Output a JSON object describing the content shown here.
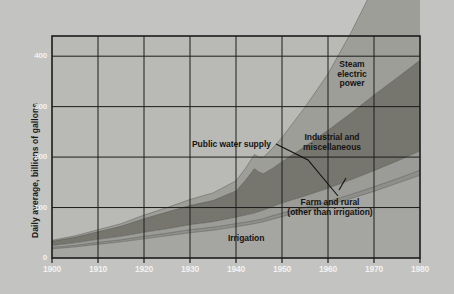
{
  "figure": {
    "background_color": "#c3c3c1",
    "plot_background_color": "#b9b9b6",
    "frame_color": "#1c1c1c"
  },
  "axes": {
    "y_title": "Daily average, billions of gallons",
    "y_ticks": [
      "0",
      "100",
      "200",
      "300",
      "400"
    ],
    "y_tick_values": [
      0,
      100,
      200,
      300,
      400
    ],
    "x_ticks": [
      "1900",
      "1910",
      "1920",
      "1930",
      "1940",
      "1950",
      "1960",
      "1970",
      "1980"
    ],
    "x_tick_values": [
      1900,
      1910,
      1920,
      1930,
      1940,
      1950,
      1960,
      1970,
      1980
    ],
    "tick_label_color": "#f2f2f0",
    "grid": true
  },
  "annotations": [
    {
      "name": "steam-electric-power",
      "lines": [
        "Steam",
        "electric",
        "power"
      ],
      "x": 352,
      "y": 60,
      "align": "center"
    },
    {
      "name": "industrial-and-miscellaneous",
      "lines": [
        "Industrial and",
        "miscellaneous"
      ],
      "x": 332,
      "y": 133,
      "align": "center"
    },
    {
      "name": "public-water-supply",
      "lines": [
        "Public water supply"
      ],
      "x": 192,
      "y": 140,
      "align": "left"
    },
    {
      "name": "farm-and-rural",
      "lines": [
        "Farm and rural",
        "(other than irrigation)"
      ],
      "x": 330,
      "y": 198,
      "align": "center"
    },
    {
      "name": "irrigation",
      "lines": [
        "Irrigation"
      ],
      "x": 228,
      "y": 234,
      "align": "left"
    }
  ],
  "chart_data": {
    "type": "area",
    "title": "",
    "subtitle": "",
    "xlabel": "",
    "ylabel": "Daily average, billions of gallons",
    "xlim": [
      1900,
      1980
    ],
    "ylim": [
      0,
      440
    ],
    "grid": true,
    "legend": "inline-annotations",
    "stacked": true,
    "units": "billions of gallons per day",
    "x": [
      1900,
      1905,
      1910,
      1915,
      1920,
      1925,
      1930,
      1935,
      1940,
      1942,
      1944,
      1945,
      1946,
      1948,
      1950,
      1955,
      1960,
      1965,
      1970,
      1975,
      1980
    ],
    "series": [
      {
        "name": "Irrigation",
        "color": "#a5a5a1",
        "values": [
          18,
          22,
          27,
          32,
          38,
          44,
          50,
          55,
          62,
          65,
          68,
          70,
          72,
          77,
          82,
          93,
          104,
          118,
          132,
          148,
          164
        ]
      },
      {
        "name": "Farm and rural (other than irrigation)",
        "color": "#8e8e8a",
        "values": [
          3,
          3,
          4,
          4,
          5,
          5,
          6,
          6,
          6,
          6,
          6,
          6,
          6,
          7,
          7,
          7,
          8,
          8,
          9,
          9,
          10
        ]
      },
      {
        "name": "Public water supply",
        "color": "#9b9b97",
        "values": [
          4,
          5,
          6,
          7,
          8,
          9,
          10,
          11,
          13,
          14,
          15,
          16,
          17,
          18,
          20,
          23,
          26,
          29,
          32,
          35,
          38
        ]
      },
      {
        "name": "Industrial and miscellaneous",
        "color": "#76766f",
        "values": [
          8,
          11,
          15,
          20,
          27,
          33,
          38,
          42,
          52,
          68,
          88,
          78,
          72,
          76,
          82,
          98,
          115,
          132,
          150,
          165,
          180
        ]
      },
      {
        "name": "Steam electric power",
        "color": "#9e9e99",
        "values": [
          2,
          3,
          4,
          5,
          7,
          9,
          12,
          15,
          20,
          24,
          28,
          30,
          33,
          40,
          48,
          78,
          112,
          160,
          215,
          280,
          350
        ]
      }
    ],
    "totals_note": "bands are cumulative from the baseline upward"
  }
}
